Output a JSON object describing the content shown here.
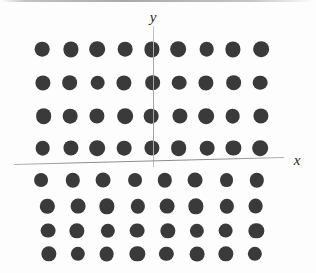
{
  "figure": {
    "title": "",
    "background_color": "#fdfdfd",
    "width": 316,
    "height": 273
  },
  "axes": {
    "x_axis": {
      "label": "x",
      "label_x": 297,
      "label_y": 160,
      "start_x": 14,
      "start_y": 164,
      "end_x": 284,
      "end_y": 157,
      "color": "#8e8e8e"
    },
    "y_axis": {
      "label": "y",
      "label_x": 153,
      "label_y": 17,
      "start_x": 153,
      "start_y": 26,
      "end_x": 153,
      "end_y": 167,
      "color": "#a0a0a0"
    }
  },
  "chart_data": {
    "type": "scatter",
    "title": "",
    "xlabel": "x",
    "ylabel": "y",
    "marker": {
      "shape": "circle",
      "color": "#3a3a3a",
      "radius": 7.5
    },
    "groups": [
      {
        "name": "upper-lattice",
        "rows": 4,
        "columns": 9,
        "row_y": [
          50,
          83,
          116,
          148
        ],
        "col_start_x": 43,
        "col_spacing": 27.2,
        "radius": 7.6
      },
      {
        "name": "axis-row",
        "rows": 1,
        "columns": 8,
        "row_y": [
          181
        ],
        "col_start_x": 42,
        "col_spacing": 30.7,
        "radius": 7.2
      },
      {
        "name": "lower-lattice",
        "rows": 3,
        "columns": 8,
        "row_y": [
          207,
          231,
          254
        ],
        "col_start_x": 48,
        "col_spacing": 29.7,
        "radius": 7.4
      }
    ],
    "total_points": 96,
    "grid": false,
    "legend": null
  }
}
